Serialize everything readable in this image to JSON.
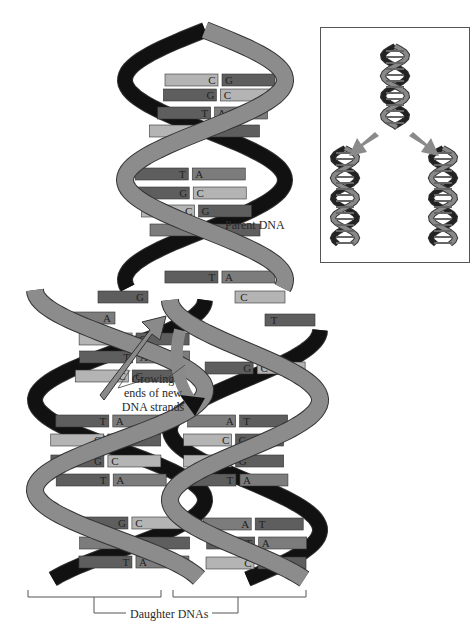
{
  "labels": {
    "parent": "Parent DNA",
    "growing": [
      "Growing",
      "ends of new",
      "DNA strands"
    ],
    "daughters": "Daughter DNAs"
  },
  "colors": {
    "backbone_front": "#8c8c8c",
    "backbone_back": "#111111",
    "base_dark": "#5e5e5e",
    "base_mid": "#7c7c7c",
    "base_light": "#b4b4b4",
    "arrow": "#8a8a8a",
    "text": "#2a2a2a"
  },
  "parent_pairs": [
    {
      "left": "C",
      "right": "G",
      "y": 80
    },
    {
      "left": "G",
      "right": "C",
      "y": 95
    },
    {
      "left": "T",
      "right": "A",
      "y": 113
    },
    {
      "left": "C",
      "right": "G",
      "y": 131
    },
    {
      "left": "T",
      "right": "A",
      "y": 174
    },
    {
      "left": "G",
      "right": "C",
      "y": 193
    },
    {
      "left": "C",
      "right": "G",
      "y": 211
    },
    {
      "left": "A",
      "right": "T",
      "y": 230
    },
    {
      "left": "T",
      "right": "A",
      "y": 277
    }
  ],
  "fork_unpaired": [
    {
      "base": "G",
      "x": 148,
      "y": 297,
      "side": "left"
    },
    {
      "base": "C",
      "x": 235,
      "y": 297,
      "side": "right"
    },
    {
      "base": "A",
      "x": 115,
      "y": 318,
      "side": "left"
    },
    {
      "base": "T",
      "x": 265,
      "y": 320,
      "side": "right"
    }
  ],
  "left_daughter_pairs": [
    {
      "left": "C",
      "right": "G",
      "y": 339
    },
    {
      "left": "T",
      "right": "A",
      "y": 357
    },
    {
      "left": "C",
      "right": "G",
      "y": 376
    },
    {
      "left": "T",
      "right": "A",
      "y": 421
    },
    {
      "left": "C",
      "right": "G",
      "y": 440
    },
    {
      "left": "G",
      "right": "C",
      "y": 461
    },
    {
      "left": "T",
      "right": "A",
      "y": 480
    },
    {
      "left": "G",
      "right": "C",
      "y": 523
    },
    {
      "left": "A",
      "right": "T",
      "y": 543
    },
    {
      "left": "T",
      "right": "A",
      "y": 562
    }
  ],
  "right_daughter_pairs": [
    {
      "left": "G",
      "right": "C",
      "y": 368
    },
    {
      "left": "A",
      "right": "T",
      "y": 421
    },
    {
      "left": "C",
      "right": "G",
      "y": 440
    },
    {
      "left": "C",
      "right": "G",
      "y": 461
    },
    {
      "left": "T",
      "right": "A",
      "y": 480
    },
    {
      "left": "A",
      "right": "T",
      "y": 524
    },
    {
      "left": "T",
      "right": "A",
      "y": 543
    },
    {
      "left": "C",
      "right": "G",
      "y": 563
    }
  ],
  "inset": {
    "description": "Overview: parent helix splitting into two daughter helices",
    "arrows": 2
  }
}
